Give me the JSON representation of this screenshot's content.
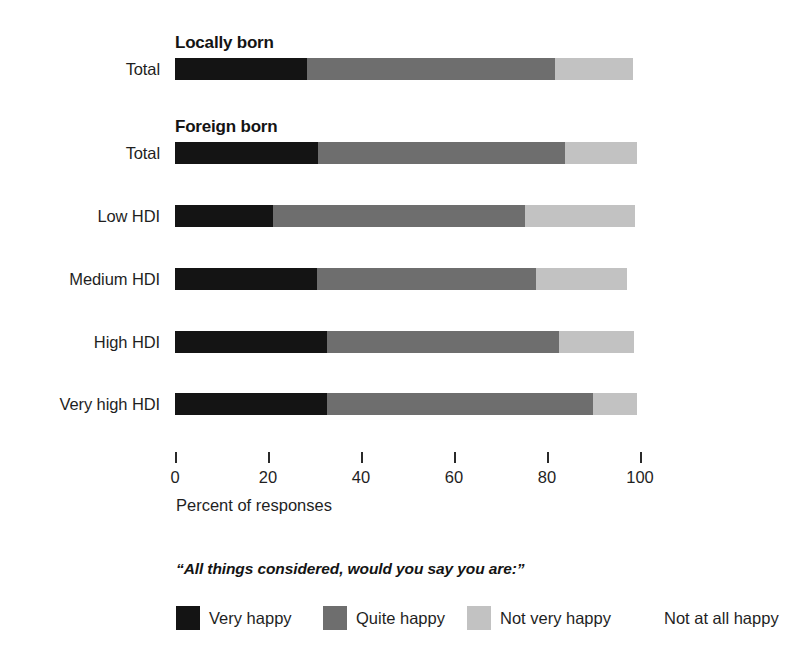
{
  "chart_data": {
    "type": "bar",
    "subtype": "stacked-horizontal-100",
    "title": "",
    "xlabel": "Percent of responses",
    "ylabel": "",
    "xlim": [
      0,
      100
    ],
    "xticks": [
      0,
      20,
      40,
      60,
      80,
      100
    ],
    "xtick_labels": [
      "0",
      "20",
      "40",
      "60",
      "80",
      "100"
    ],
    "grid": false,
    "legend_position": "bottom",
    "legend_question": "“All things considered, would you say you are:”",
    "series": [
      {
        "name": "Very happy",
        "color": "#141414",
        "values": [
          28.4,
          30.7,
          21.1,
          30.5,
          32.7,
          32.7
        ]
      },
      {
        "name": "Quite happy",
        "color": "#6e6e6e",
        "values": [
          53.3,
          53.2,
          54.2,
          47.1,
          49.9,
          57.2
        ]
      },
      {
        "name": "Not very happy",
        "color": "#c2c2c2",
        "values": [
          16.8,
          15.5,
          23.7,
          19.6,
          16.1,
          9.5
        ]
      },
      {
        "name": "Not at all happy",
        "color": "#ffffff",
        "values": [
          1.5,
          0.6,
          1.0,
          2.8,
          1.3,
          0.6
        ]
      }
    ],
    "categories": [
      "Total",
      "Total",
      "Low HDI",
      "Medium HDI",
      "High HDI",
      "Very high HDI"
    ],
    "groups": [
      {
        "header": "Locally born",
        "rows": [
          "Total"
        ]
      },
      {
        "header": "Foreign born",
        "rows": [
          "Total",
          "Low HDI",
          "Medium HDI",
          "High HDI",
          "Very high HDI"
        ]
      }
    ]
  },
  "rows": [
    {
      "label": "Total",
      "group": "Locally born",
      "header": "Locally born",
      "segments": [
        28.4,
        53.3,
        16.8,
        1.5
      ]
    },
    {
      "label": "Total",
      "group": "Foreign born",
      "header": "Foreign born",
      "segments": [
        30.7,
        53.2,
        15.5,
        0.6
      ]
    },
    {
      "label": "Low HDI",
      "group": "Foreign born",
      "header": "",
      "segments": [
        21.1,
        54.2,
        23.7,
        1.0
      ]
    },
    {
      "label": "Medium HDI",
      "group": "Foreign born",
      "header": "",
      "segments": [
        30.5,
        47.1,
        19.6,
        2.8
      ]
    },
    {
      "label": "High HDI",
      "group": "Foreign born",
      "header": "",
      "segments": [
        32.7,
        49.9,
        16.1,
        1.3
      ]
    },
    {
      "label": "Very high HDI",
      "group": "Foreign born",
      "header": "",
      "segments": [
        32.7,
        57.2,
        9.5,
        0.6
      ]
    }
  ],
  "axis": {
    "title": "Percent of responses",
    "ticks": [
      {
        "value": 0,
        "label": "0"
      },
      {
        "value": 20,
        "label": "20"
      },
      {
        "value": 40,
        "label": "40"
      },
      {
        "value": 60,
        "label": "60"
      },
      {
        "value": 80,
        "label": "80"
      },
      {
        "value": 100,
        "label": "100"
      }
    ]
  },
  "legend": {
    "question": "“All things considered, would you say you are:”",
    "items": [
      {
        "label": "Very happy",
        "color": "#141414"
      },
      {
        "label": "Quite happy",
        "color": "#6e6e6e"
      },
      {
        "label": "Not very happy",
        "color": "#c2c2c2"
      },
      {
        "label": "Not at all happy",
        "color": "#ffffff"
      }
    ]
  },
  "colors": {
    "very_happy": "#141414",
    "quite_happy": "#6e6e6e",
    "not_very_happy": "#c2c2c2",
    "not_at_all_happy": "#ffffff",
    "text": "#1f1f1f",
    "background": "#ffffff"
  }
}
